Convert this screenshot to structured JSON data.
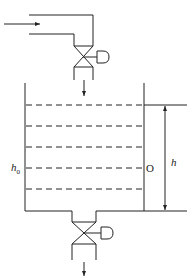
{
  "diagram": {
    "type": "tank level control schematic",
    "labels": {
      "initial_level": "h",
      "initial_level_sub": "0",
      "origin": "O",
      "height": "h"
    },
    "components": [
      {
        "name": "inlet-pipe",
        "flow": "in"
      },
      {
        "name": "inlet-valve",
        "kind": "control valve with actuator"
      },
      {
        "name": "tank",
        "level_lines": 5
      },
      {
        "name": "outlet-valve",
        "kind": "control valve with actuator"
      },
      {
        "name": "outlet-pipe",
        "flow": "out"
      }
    ],
    "colors": {
      "stroke": "#222222",
      "background": "#ffffff"
    }
  }
}
